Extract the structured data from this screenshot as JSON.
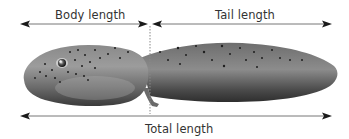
{
  "figure": {
    "labels": {
      "body_length": "Body length",
      "tail_length": "Tail length",
      "total_length": "Total length"
    },
    "measurements": [
      {
        "name": "body_length",
        "label": "Body length",
        "x_start": 20,
        "x_end": 148,
        "y": 24
      },
      {
        "name": "tail_length",
        "label": "Tail length",
        "x_start": 152,
        "x_end": 332,
        "y": 24
      },
      {
        "name": "total_length",
        "label": "Total length",
        "x_start": 20,
        "x_end": 332,
        "y": 116
      }
    ],
    "divider": {
      "x": 150,
      "y_start": 26,
      "y_end": 114,
      "style": "dotted"
    },
    "colors": {
      "arrow": "#1a1a1a",
      "line": "#777777",
      "text": "#333333",
      "body_dark": "#3c3c3c",
      "body_mid": "#6e6e6e",
      "body_light": "#9a9a9a",
      "spots": "#1e1e1e"
    }
  }
}
